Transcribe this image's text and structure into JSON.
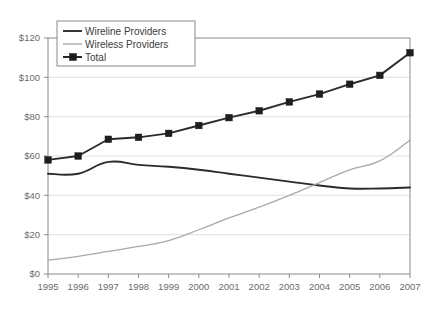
{
  "chart_data": {
    "type": "line",
    "title": "",
    "subtitle": "",
    "xlabel": "",
    "ylabel": "",
    "x": [
      1995,
      1996,
      1997,
      1998,
      1999,
      2000,
      2001,
      2002,
      2003,
      2004,
      2005,
      2006,
      2007
    ],
    "xtick_labels": [
      "1995",
      "1996",
      "1997",
      "1998",
      "1999",
      "2000",
      "2001",
      "2002",
      "2003",
      "2004",
      "2005",
      "2006",
      "2007"
    ],
    "ytick_labels": [
      "$0",
      "$20",
      "$40",
      "$60",
      "$80",
      "$100",
      "$120"
    ],
    "ytick_values": [
      0,
      20,
      40,
      60,
      80,
      100,
      120
    ],
    "ylim": [
      0,
      120
    ],
    "xlim": [
      1995,
      2007
    ],
    "grid": true,
    "legend_position": "top-left",
    "series": [
      {
        "name": "Wireline Providers",
        "style": "line",
        "color": "#2b2b2b",
        "marker": "none",
        "values": [
          51,
          51,
          57,
          55.5,
          54.5,
          53,
          51,
          49,
          47,
          45,
          43.5,
          43.5,
          44
        ]
      },
      {
        "name": "Wireless Providers",
        "style": "line",
        "color": "#a9a9a9",
        "marker": "none",
        "values": [
          7,
          9,
          11.5,
          14,
          17,
          22.5,
          28.5,
          34,
          40,
          46.5,
          53,
          57.5,
          68
        ]
      },
      {
        "name": "Total",
        "style": "line-marker",
        "color": "#1e1e1e",
        "marker": "square",
        "values": [
          58,
          60,
          68.5,
          69.5,
          71.5,
          75.5,
          79.5,
          83,
          87.5,
          91.5,
          96.5,
          101,
          112.5
        ]
      }
    ]
  },
  "legend": {
    "items": [
      {
        "label": "Wireline Providers"
      },
      {
        "label": "Wireless Providers"
      },
      {
        "label": "Total"
      }
    ]
  },
  "caption": {
    "text": ""
  },
  "colors": {
    "wireline": "#2b2b2b",
    "wireless": "#a9a9a9",
    "total": "#1e1e1e",
    "grid": "#d8d8d8",
    "axis": "#8a8a8a",
    "tick_text": "#6b6b6b",
    "background": "#ffffff"
  }
}
